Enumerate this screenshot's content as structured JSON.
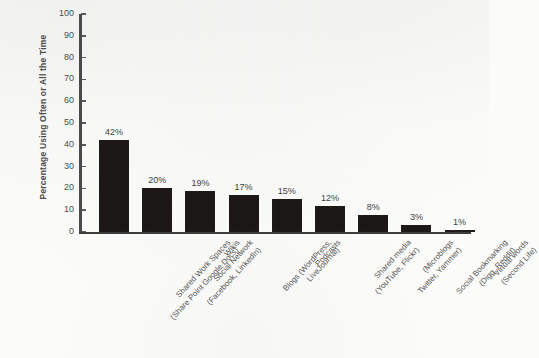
{
  "chart_data": {
    "type": "bar",
    "title": "",
    "xlabel": "",
    "ylabel": "Percentage Using Often or All the Time",
    "ylim": [
      0,
      100
    ],
    "ytick_labels": [
      "100",
      "90",
      "80",
      "70",
      "60",
      "50",
      "40",
      "30",
      "20",
      "10",
      "0"
    ],
    "ytick_values": [
      100,
      90,
      80,
      70,
      60,
      50,
      40,
      30,
      20,
      10,
      0
    ],
    "grid": false,
    "legend": null,
    "categories": [
      "Shared Work Spaces (Share Point Google Docs)",
      "Social Network (Facebook, LinkedIn)",
      "Wikis",
      "Blogs (WordPress, LiveJournal)",
      "Podcasts",
      "Shared media (YouTube, Flickr)",
      "(Microblogs Twitter, Yammer)",
      "Social Bookmarking (Digg, Reddit)",
      "Virtual words (Second Life)"
    ],
    "values": [
      42,
      20,
      19,
      17,
      15,
      12,
      8,
      3,
      1
    ],
    "data_labels": [
      "42%",
      "20%",
      "19%",
      "17%",
      "15%",
      "12%",
      "8%",
      "3%",
      "1%"
    ],
    "bar_color": "#1b1714",
    "bars": [
      {
        "label_line1": "Shared Work Spaces",
        "label_line2": "(Share Point Google Docs)",
        "value": 42,
        "data_label": "42%"
      },
      {
        "label_line1": "Social Network",
        "label_line2": "(Facebook, LinkedIn)",
        "value": 20,
        "data_label": "20%"
      },
      {
        "label_line1": "Wikis",
        "label_line2": "",
        "value": 19,
        "data_label": "19%"
      },
      {
        "label_line1": "Blogs (WordPress,",
        "label_line2": "LiveJournal)",
        "value": 17,
        "data_label": "17%"
      },
      {
        "label_line1": "Podcasts",
        "label_line2": "",
        "value": 15,
        "data_label": "15%"
      },
      {
        "label_line1": "Shared media",
        "label_line2": "(YouTube, Flickr)",
        "value": 12,
        "data_label": "12%"
      },
      {
        "label_line1": "(Microblogs",
        "label_line2": "Twitter, Yammer)",
        "value": 8,
        "data_label": "8%"
      },
      {
        "label_line1": "Social Bookmarking",
        "label_line2": "(Digg, Reddit)",
        "value": 3,
        "data_label": "3%"
      },
      {
        "label_line1": "Virtual words",
        "label_line2": "(Second Life)",
        "value": 1,
        "data_label": "1%"
      }
    ]
  }
}
